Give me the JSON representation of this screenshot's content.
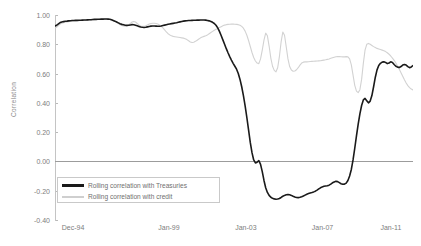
{
  "chart_data": {
    "type": "line",
    "title": "",
    "xlabel": "",
    "ylabel": "Correlation",
    "ylim": [
      -0.4,
      1.0
    ],
    "yticks": [
      1.0,
      0.8,
      0.6,
      0.4,
      0.2,
      0.0,
      -0.2,
      -0.4
    ],
    "ytick_labels": [
      "1.00",
      "0.80",
      "0.60",
      "0.40",
      "0.20",
      "0.00",
      "-0.20",
      "-0.40"
    ],
    "grid": false,
    "legend_position": "lower-left",
    "xtick_labels": [
      "Dec-94",
      "Jan-99",
      "Jan-03",
      "Jan-07",
      "Jan-11"
    ],
    "xtick_positions": [
      0,
      0.268,
      0.483,
      0.697,
      0.888
    ],
    "xlim_labels": [
      "Dec-94",
      "Jan-13"
    ],
    "series": [
      {
        "name": "Rolling correlation with Treasuries",
        "color": "#1a1a1a",
        "values": [
          0.925,
          0.93,
          0.94,
          0.948,
          0.952,
          0.955,
          0.957,
          0.958,
          0.96,
          0.961,
          0.962,
          0.962,
          0.963,
          0.963,
          0.964,
          0.964,
          0.965,
          0.966,
          0.966,
          0.967,
          0.968,
          0.968,
          0.969,
          0.97,
          0.97,
          0.971,
          0.971,
          0.972,
          0.972,
          0.973,
          0.973,
          0.972,
          0.971,
          0.968,
          0.963,
          0.958,
          0.952,
          0.946,
          0.94,
          0.936,
          0.933,
          0.93,
          0.929,
          0.93,
          0.932,
          0.934,
          0.933,
          0.93,
          0.926,
          0.922,
          0.918,
          0.916,
          0.915,
          0.916,
          0.919,
          0.922,
          0.924,
          0.925,
          0.925,
          0.924,
          0.923,
          0.923,
          0.925,
          0.928,
          0.931,
          0.934,
          0.937,
          0.939,
          0.941,
          0.943,
          0.945,
          0.947,
          0.95,
          0.953,
          0.956,
          0.958,
          0.96,
          0.961,
          0.962,
          0.962,
          0.963,
          0.964,
          0.964,
          0.965,
          0.965,
          0.966,
          0.966,
          0.966,
          0.965,
          0.963,
          0.96,
          0.956,
          0.95,
          0.942,
          0.93,
          0.912,
          0.888,
          0.86,
          0.83,
          0.8,
          0.77,
          0.742,
          0.716,
          0.692,
          0.67,
          0.65,
          0.63,
          0.6,
          0.56,
          0.51,
          0.45,
          0.38,
          0.3,
          0.215,
          0.13,
          0.06,
          0.01,
          -0.01,
          -0.005,
          0.005,
          -0.02,
          -0.07,
          -0.13,
          -0.18,
          -0.212,
          -0.232,
          -0.245,
          -0.252,
          -0.256,
          -0.258,
          -0.257,
          -0.253,
          -0.246,
          -0.238,
          -0.232,
          -0.228,
          -0.226,
          -0.228,
          -0.232,
          -0.238,
          -0.243,
          -0.246,
          -0.247,
          -0.245,
          -0.241,
          -0.236,
          -0.23,
          -0.224,
          -0.219,
          -0.215,
          -0.212,
          -0.208,
          -0.203,
          -0.196,
          -0.188,
          -0.18,
          -0.174,
          -0.17,
          -0.168,
          -0.166,
          -0.162,
          -0.155,
          -0.146,
          -0.14,
          -0.136,
          -0.138,
          -0.145,
          -0.152,
          -0.156,
          -0.155,
          -0.148,
          -0.13,
          -0.1,
          -0.055,
          0.01,
          0.09,
          0.175,
          0.255,
          0.325,
          0.382,
          0.42,
          0.43,
          0.415,
          0.4,
          0.412,
          0.45,
          0.51,
          0.575,
          0.625,
          0.655,
          0.67,
          0.678,
          0.68,
          0.676,
          0.668,
          0.672,
          0.68,
          0.676,
          0.662,
          0.65,
          0.644,
          0.642,
          0.648,
          0.658,
          0.662,
          0.658,
          0.648,
          0.64,
          0.645,
          0.655
        ]
      },
      {
        "name": "Rolling correlation with credit",
        "color": "#d2d2d2",
        "values": [
          0.912,
          0.918,
          0.928,
          0.938,
          0.944,
          0.948,
          0.951,
          0.953,
          0.955,
          0.957,
          0.958,
          0.959,
          0.96,
          0.961,
          0.961,
          0.962,
          0.963,
          0.964,
          0.964,
          0.965,
          0.966,
          0.967,
          0.967,
          0.968,
          0.969,
          0.969,
          0.97,
          0.97,
          0.971,
          0.971,
          0.972,
          0.971,
          0.969,
          0.966,
          0.961,
          0.955,
          0.948,
          0.941,
          0.934,
          0.929,
          0.925,
          0.924,
          0.926,
          0.932,
          0.942,
          0.952,
          0.956,
          0.952,
          0.942,
          0.932,
          0.925,
          0.922,
          0.922,
          0.926,
          0.932,
          0.938,
          0.942,
          0.944,
          0.944,
          0.942,
          0.938,
          0.932,
          0.924,
          0.912,
          0.898,
          0.884,
          0.872,
          0.864,
          0.858,
          0.854,
          0.852,
          0.85,
          0.848,
          0.846,
          0.844,
          0.842,
          0.838,
          0.832,
          0.824,
          0.816,
          0.812,
          0.814,
          0.82,
          0.828,
          0.836,
          0.844,
          0.85,
          0.854,
          0.858,
          0.864,
          0.872,
          0.88,
          0.888,
          0.896,
          0.902,
          0.908,
          0.914,
          0.92,
          0.926,
          0.931,
          0.934,
          0.936,
          0.937,
          0.938,
          0.938,
          0.937,
          0.936,
          0.934,
          0.93,
          0.922,
          0.91,
          0.89,
          0.862,
          0.826,
          0.785,
          0.744,
          0.71,
          0.686,
          0.672,
          0.668,
          0.7,
          0.76,
          0.828,
          0.876,
          0.858,
          0.788,
          0.706,
          0.65,
          0.622,
          0.612,
          0.64,
          0.716,
          0.816,
          0.884,
          0.862,
          0.782,
          0.7,
          0.648,
          0.624,
          0.616,
          0.618,
          0.626,
          0.64,
          0.658,
          0.672,
          0.678,
          0.68,
          0.68,
          0.681,
          0.682,
          0.683,
          0.684,
          0.685,
          0.686,
          0.687,
          0.688,
          0.69,
          0.692,
          0.694,
          0.697,
          0.7,
          0.704,
          0.708,
          0.712,
          0.715,
          0.716,
          0.716,
          0.715,
          0.714,
          0.714,
          0.716,
          0.714,
          0.7,
          0.66,
          0.59,
          0.52,
          0.48,
          0.47,
          0.49,
          0.56,
          0.67,
          0.76,
          0.8,
          0.806,
          0.8,
          0.792,
          0.784,
          0.778,
          0.772,
          0.768,
          0.764,
          0.76,
          0.756,
          0.75,
          0.742,
          0.732,
          0.72,
          0.706,
          0.69,
          0.672,
          0.652,
          0.63,
          0.606,
          0.582,
          0.558,
          0.536,
          0.518,
          0.504,
          0.494,
          0.488
        ]
      }
    ]
  },
  "legend": {
    "items": [
      {
        "label": "Rolling correlation with Treasuries",
        "color": "#1a1a1a"
      },
      {
        "label": "Rolling correlation with credit",
        "color": "#d2d2d2"
      }
    ]
  }
}
